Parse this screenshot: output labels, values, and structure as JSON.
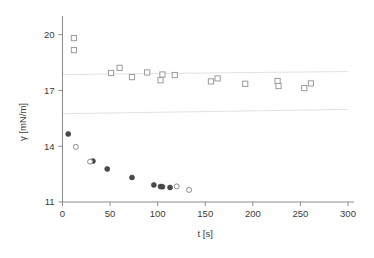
{
  "chart_data": {
    "type": "scatter",
    "title": "",
    "xlabel": "t [s]",
    "ylabel": "γ [mN/m]",
    "xlim": [
      0,
      300
    ],
    "ylim": [
      11,
      20.9
    ],
    "xticks": [
      0,
      50,
      100,
      150,
      200,
      250,
      300
    ],
    "xticklabels": [
      "0",
      "50",
      "100",
      "150",
      "200",
      "250",
      "300"
    ],
    "yticks": [
      11,
      14,
      17,
      20
    ],
    "yticklabels": [
      "11",
      "14",
      "17",
      "20"
    ],
    "grid": false,
    "legend": "none",
    "annotations": [
      {
        "name": "upper-trend-guide",
        "type": "line",
        "x": [
          0,
          300
        ],
        "y": [
          17.86,
          18.02
        ],
        "color": "#e2e2e2"
      },
      {
        "name": "lower-trend-guide",
        "type": "line",
        "x": [
          0,
          300
        ],
        "y": [
          15.75,
          15.98
        ],
        "color": "#e2e2e2"
      }
    ],
    "series": [
      {
        "name": "upper-series-open-squares",
        "marker": "open-square",
        "color": "#9b9b9b",
        "points": [
          {
            "x": 12,
            "y": 19.82
          },
          {
            "x": 12,
            "y": 19.17
          },
          {
            "x": 51,
            "y": 17.94
          },
          {
            "x": 60,
            "y": 18.22
          },
          {
            "x": 73,
            "y": 17.72
          },
          {
            "x": 89,
            "y": 17.97
          },
          {
            "x": 103,
            "y": 17.55
          },
          {
            "x": 105,
            "y": 17.86
          },
          {
            "x": 118,
            "y": 17.83
          },
          {
            "x": 156,
            "y": 17.49
          },
          {
            "x": 163,
            "y": 17.65
          },
          {
            "x": 192,
            "y": 17.36
          },
          {
            "x": 226,
            "y": 17.51
          },
          {
            "x": 227,
            "y": 17.24
          },
          {
            "x": 254,
            "y": 17.13
          },
          {
            "x": 261,
            "y": 17.38
          }
        ]
      },
      {
        "name": "lower-series-filled-circles",
        "marker": "filled-circle",
        "color": "#4a4a4a",
        "points": [
          {
            "x": 6,
            "y": 14.66
          },
          {
            "x": 32,
            "y": 13.2
          },
          {
            "x": 47,
            "y": 12.78
          },
          {
            "x": 73,
            "y": 12.32
          },
          {
            "x": 96,
            "y": 11.92
          },
          {
            "x": 103,
            "y": 11.83
          },
          {
            "x": 105,
            "y": 11.82
          },
          {
            "x": 113,
            "y": 11.78
          }
        ]
      },
      {
        "name": "lower-series-open-circles",
        "marker": "open-circle",
        "color": "#8d8d8d",
        "points": [
          {
            "x": 14,
            "y": 13.97
          },
          {
            "x": 29,
            "y": 13.17
          },
          {
            "x": 120,
            "y": 11.84
          },
          {
            "x": 133,
            "y": 11.65
          }
        ]
      }
    ]
  },
  "figure": {
    "background": "#ffffff",
    "axis_color": "#8a8a8a",
    "text_color": "#3a3a3a"
  }
}
